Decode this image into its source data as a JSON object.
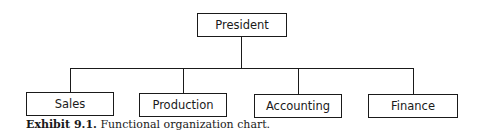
{
  "diagram": {
    "type": "org-chart",
    "root": {
      "label": "President"
    },
    "children": [
      {
        "label": "Sales"
      },
      {
        "label": "Production"
      },
      {
        "label": "Accounting"
      },
      {
        "label": "Finance"
      }
    ]
  },
  "caption": {
    "label": "Exhibit 9.1.",
    "text": "Functional organization chart."
  }
}
